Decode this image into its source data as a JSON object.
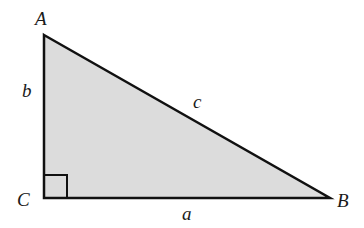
{
  "diagram": {
    "fill_color": "#dcdcdc",
    "stroke_color": "#111111",
    "vertices": {
      "A": {
        "label": "A",
        "x": 44,
        "y": 35
      },
      "B": {
        "label": "B",
        "x": 330,
        "y": 198
      },
      "C": {
        "label": "C",
        "x": 44,
        "y": 198
      }
    },
    "sides": {
      "a": {
        "label": "a"
      },
      "b": {
        "label": "b"
      },
      "c": {
        "label": "c"
      }
    },
    "right_angle_at": "C"
  }
}
